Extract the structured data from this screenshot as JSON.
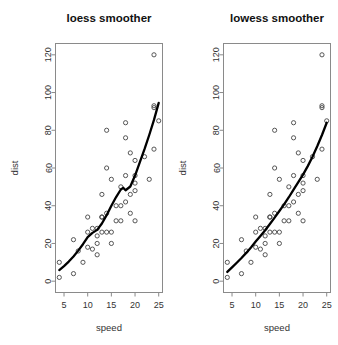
{
  "figure": {
    "background": "#ffffff",
    "width": 338,
    "height": 345,
    "point_color": "#444444",
    "curve_color": "#000000",
    "frame_color": "#8a8a8a"
  },
  "panels": [
    {
      "name": "loess-panel",
      "title": "loess smoother",
      "xlabel": "speed",
      "ylabel": "dist"
    },
    {
      "name": "lowess-panel",
      "title": "lowess smoother",
      "xlabel": "speed",
      "ylabel": "dist"
    }
  ],
  "chart_data": [
    {
      "type": "scatter",
      "title": "loess smoother",
      "xlabel": "speed",
      "ylabel": "dist",
      "xlim": [
        3.2,
        25.8
      ],
      "ylim": [
        -6,
        126
      ],
      "xticks": [
        5,
        10,
        15,
        20,
        25
      ],
      "yticks": [
        0,
        20,
        40,
        60,
        80,
        100,
        120
      ],
      "grid": false,
      "legend": "none",
      "x": [
        4,
        4,
        7,
        7,
        8,
        9,
        10,
        10,
        10,
        11,
        11,
        12,
        12,
        12,
        12,
        13,
        13,
        13,
        13,
        14,
        14,
        14,
        14,
        15,
        15,
        15,
        16,
        16,
        17,
        17,
        17,
        18,
        18,
        18,
        18,
        19,
        19,
        19,
        20,
        20,
        20,
        20,
        20,
        22,
        23,
        24,
        24,
        24,
        24,
        25
      ],
      "y": [
        2,
        10,
        4,
        22,
        16,
        10,
        18,
        26,
        34,
        17,
        28,
        14,
        20,
        24,
        28,
        26,
        34,
        34,
        46,
        26,
        36,
        60,
        80,
        20,
        26,
        54,
        32,
        40,
        32,
        40,
        50,
        42,
        56,
        76,
        84,
        36,
        46,
        68,
        32,
        48,
        52,
        56,
        64,
        66,
        54,
        70,
        92,
        93,
        120,
        85
      ],
      "series": [
        {
          "name": "loess smoother",
          "type": "line",
          "x": [
            4,
            5,
            6,
            7,
            8,
            9,
            10,
            11,
            12,
            13,
            14,
            15,
            16,
            17,
            17.5,
            18,
            19,
            20,
            21,
            22,
            23,
            24,
            25
          ],
          "y": [
            5.9,
            8.0,
            10.4,
            13.1,
            16.2,
            19.6,
            23.4,
            25.6,
            27.2,
            30.6,
            35.0,
            40.0,
            44.6,
            48.6,
            49.5,
            48.2,
            50.2,
            56.0,
            63.0,
            70.0,
            77.5,
            85.5,
            94.5
          ]
        }
      ]
    },
    {
      "type": "scatter",
      "title": "lowess smoother",
      "xlabel": "speed",
      "ylabel": "dist",
      "xlim": [
        3.2,
        25.8
      ],
      "ylim": [
        -6,
        126
      ],
      "xticks": [
        5,
        10,
        15,
        20,
        25
      ],
      "yticks": [
        0,
        20,
        40,
        60,
        80,
        100,
        120
      ],
      "grid": false,
      "legend": "none",
      "x": [
        4,
        4,
        7,
        7,
        8,
        9,
        10,
        10,
        10,
        11,
        11,
        12,
        12,
        12,
        12,
        13,
        13,
        13,
        13,
        14,
        14,
        14,
        14,
        15,
        15,
        15,
        16,
        16,
        17,
        17,
        17,
        18,
        18,
        18,
        18,
        19,
        19,
        19,
        20,
        20,
        20,
        20,
        20,
        22,
        23,
        24,
        24,
        24,
        24,
        25
      ],
      "y": [
        2,
        10,
        4,
        22,
        16,
        10,
        18,
        26,
        34,
        17,
        28,
        14,
        20,
        24,
        28,
        26,
        34,
        34,
        46,
        26,
        36,
        60,
        80,
        20,
        26,
        54,
        32,
        40,
        32,
        40,
        50,
        42,
        56,
        76,
        84,
        36,
        46,
        68,
        32,
        48,
        52,
        56,
        64,
        66,
        54,
        70,
        92,
        93,
        120,
        85
      ],
      "series": [
        {
          "name": "lowess smoother",
          "type": "line",
          "x": [
            4,
            5,
            6,
            7,
            8,
            9,
            10,
            11,
            12,
            13,
            14,
            15,
            16,
            17,
            18,
            19,
            20,
            21,
            22,
            23,
            24,
            25
          ],
          "y": [
            4.9,
            7.3,
            9.8,
            12.3,
            15.0,
            17.9,
            21.0,
            24.0,
            27.0,
            30.3,
            33.7,
            37.2,
            40.7,
            44.5,
            48.5,
            52.5,
            56.5,
            61.0,
            66.0,
            71.5,
            77.5,
            84.0
          ]
        }
      ]
    }
  ]
}
